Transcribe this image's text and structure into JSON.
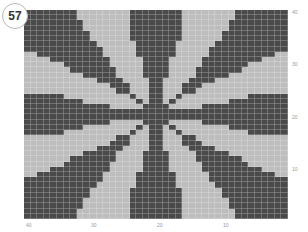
{
  "badge": {
    "number": "57"
  },
  "chart": {
    "columns": 40,
    "rows": 40,
    "colors": {
      "dark": "#4a4a4a",
      "light": "#bdbdbd",
      "gridline": "#d8d8d8"
    },
    "y_axis_labels": [
      {
        "text": "40",
        "top": 9
      },
      {
        "text": "30",
        "top": 61
      },
      {
        "text": "20",
        "top": 114
      },
      {
        "text": "10",
        "top": 166
      }
    ],
    "x_axis_labels": [
      {
        "text": "40",
        "left": 26
      },
      {
        "text": "30",
        "left": 91
      },
      {
        "text": "20",
        "left": 157
      },
      {
        "text": "10",
        "left": 223
      }
    ],
    "pattern": {
      "description": "8-spoke radial star motif",
      "spokes": [
        "top",
        "bottom",
        "left",
        "right",
        "top-left",
        "top-right",
        "bottom-left",
        "bottom-right"
      ],
      "straight_spoke_max_halfwidth": 3.5,
      "straight_spoke_thin_radius": 4,
      "straight_spoke_growth": 0.3,
      "diagonal_spoke_ratio": 0.42,
      "diagonal_thin_radius": 4
    }
  }
}
